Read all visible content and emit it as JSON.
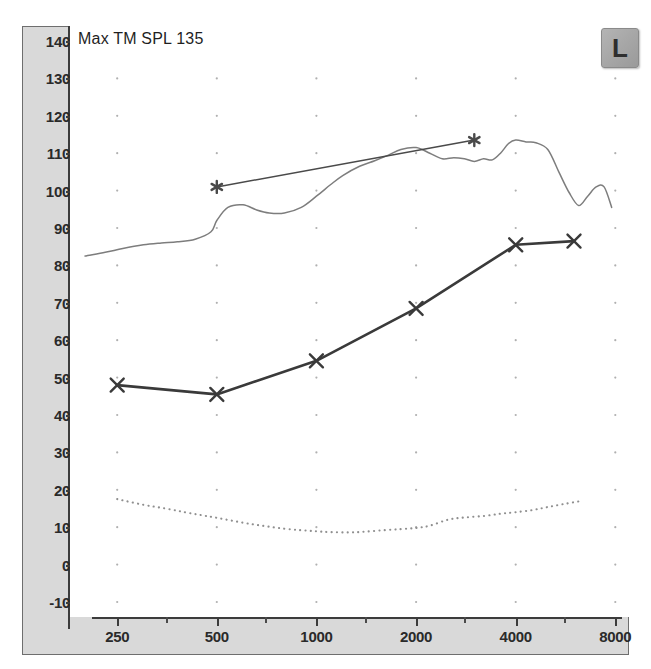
{
  "chart_title": "Max TM SPL 135",
  "ear_badge": {
    "label": "L",
    "name": "left-ear-indicator"
  },
  "axes": {
    "y": {
      "label": "",
      "unit": "dB SPL",
      "min": -10,
      "max": 140,
      "step": 10,
      "ticks": [
        140,
        130,
        120,
        110,
        100,
        90,
        80,
        70,
        60,
        50,
        40,
        30,
        20,
        10,
        0,
        -10
      ]
    },
    "x": {
      "label": "",
      "unit": "Hz",
      "scale": "log",
      "min": 180,
      "max": 8800,
      "major_ticks": [
        250,
        500,
        1000,
        2000,
        4000,
        8000
      ],
      "minor_ticks": [
        350,
        700,
        1400,
        2800,
        5600
      ]
    }
  },
  "grid": {
    "dots": true,
    "dot_color": "#b0b0b0",
    "x_positions": [
      250,
      500,
      1000,
      2000,
      4000,
      8000
    ],
    "y_positions": [
      130,
      120,
      110,
      100,
      90,
      80,
      70,
      60,
      50,
      40,
      30,
      20,
      10,
      0,
      -10
    ]
  },
  "chart_data": {
    "type": "line",
    "title": "Max TM SPL 135",
    "xlabel": "Frequency (Hz)",
    "ylabel": "dB SPL",
    "xscale": "log",
    "xlim": [
      180,
      8800
    ],
    "ylim": [
      -10,
      140
    ],
    "grid": true,
    "legend": "none",
    "series": [
      {
        "name": "Max TM SPL (saturation response)",
        "style": "solid-thin",
        "color": "#7d7d7d",
        "marker": "none",
        "x": [
          200,
          230,
          260,
          300,
          340,
          380,
          430,
          480,
          500,
          540,
          600,
          660,
          720,
          800,
          900,
          1000,
          1100,
          1200,
          1350,
          1500,
          1650,
          1800,
          2000,
          2200,
          2400,
          2600,
          2800,
          3000,
          3200,
          3400,
          3600,
          3800,
          4000,
          4300,
          4600,
          5000,
          5400,
          5800,
          6200,
          6600,
          7000,
          7400,
          7800
        ],
        "y": [
          82.5,
          83.5,
          84.5,
          85.5,
          86.0,
          86.3,
          87.0,
          89.0,
          92.0,
          95.5,
          96.2,
          94.8,
          94.0,
          94.0,
          95.5,
          98.5,
          101.5,
          104.0,
          106.5,
          108.0,
          109.5,
          111.0,
          111.5,
          110.0,
          108.5,
          108.8,
          108.5,
          107.8,
          108.5,
          108.2,
          110.0,
          112.5,
          113.5,
          113.0,
          112.8,
          111.0,
          105.0,
          99.5,
          96.0,
          98.5,
          101.0,
          101.0,
          95.5
        ]
      },
      {
        "name": "Target / prescriptive line (asterisk)",
        "style": "solid-thin",
        "color": "#4a4a4a",
        "marker": "asterisk",
        "x": [
          500,
          3000
        ],
        "y": [
          101.0,
          113.5
        ]
      },
      {
        "name": "Aided response (X markers)",
        "style": "solid-thick",
        "color": "#3a3a3a",
        "marker": "x",
        "x": [
          250,
          500,
          1000,
          2000,
          4000,
          6000
        ],
        "y": [
          48.0,
          45.5,
          54.5,
          68.5,
          85.5,
          86.5
        ]
      },
      {
        "name": "Noise floor / REUG (dotted)",
        "style": "dotted",
        "color": "#8f8f8f",
        "marker": "none",
        "x": [
          250,
          300,
          350,
          400,
          450,
          500,
          600,
          700,
          800,
          900,
          1000,
          1100,
          1250,
          1400,
          1600,
          1800,
          2000,
          2200,
          2500,
          2800,
          3200,
          3600,
          4000,
          4500,
          5000,
          5600,
          6300
        ],
        "y": [
          17.5,
          16.0,
          15.0,
          14.0,
          13.2,
          12.5,
          11.2,
          10.3,
          9.6,
          9.2,
          8.9,
          8.7,
          8.6,
          8.8,
          9.2,
          9.5,
          9.8,
          10.4,
          12.0,
          12.6,
          13.0,
          13.6,
          14.0,
          14.6,
          15.4,
          16.2,
          17.0
        ]
      }
    ]
  },
  "colors": {
    "axis_band": "#d9d9d9",
    "axis_line": "#3c3c3c",
    "plot_bg": "#ffffff",
    "tick_text": "#2a2a2a",
    "grid_dot": "#b0b0b0"
  }
}
